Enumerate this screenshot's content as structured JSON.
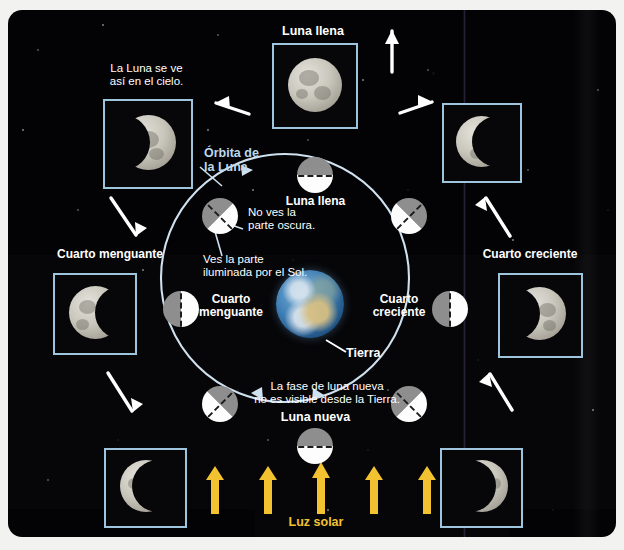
{
  "diagram": {
    "language": "es"
  },
  "colors": {
    "frame_border": "#9fc4dd",
    "orbit_line": "#cfe0ee",
    "accent_blue": "#bcd8ee",
    "sun_yellow": "#f2c230",
    "sky": "#060608",
    "moon_lit": "#fdfdfd",
    "moon_dark": "#8e8e8e"
  },
  "photos": [
    {
      "id": "photo-waning-gibbous",
      "label": "",
      "caption": "La Luna se ve\nasí en el cielo.",
      "caption_line1": "La Luna se ve",
      "caption_line2": "así en el cielo.",
      "phase": "waning-gibbous"
    },
    {
      "id": "photo-full-moon",
      "label": "Luna llena",
      "phase": "full"
    },
    {
      "id": "photo-waxing-gibbous",
      "label": "",
      "phase": "waxing-gibbous"
    },
    {
      "id": "photo-last-quarter",
      "label": "Cuarto menguante",
      "phase": "last-quarter"
    },
    {
      "id": "photo-first-quarter",
      "label": "Cuarto creciente",
      "phase": "first-quarter"
    },
    {
      "id": "photo-waning-crescent",
      "label": "",
      "phase": "waning-crescent"
    },
    {
      "id": "photo-waxing-crescent",
      "label": "",
      "phase": "waxing-crescent"
    }
  ],
  "labels": {
    "orbit_line1": "Órbita de",
    "orbit_line2": "la Luna",
    "full_moon": "Luna llena",
    "new_moon": "Luna nueva",
    "last_quarter_line1": "Cuarto",
    "last_quarter_line2": "menguante",
    "first_quarter_line1": "Cuarto",
    "first_quarter_line2": "creciente",
    "earth": "Tierra",
    "sunlight": "Luz solar",
    "photo_top_caption_line1": "La Luna se ve",
    "photo_top_caption_line2": "así en el cielo.",
    "photo_full_moon": "Luna llena",
    "photo_last_quarter": "Cuarto menguante",
    "photo_first_quarter": "Cuarto creciente",
    "note_dark_line1": "No ves la",
    "note_dark_line2": "parte oscura.",
    "note_lit_line1": "Ves la parte",
    "note_lit_line2": "iluminada por el Sol.",
    "note_new_line1": "La fase de luna nueva",
    "note_new_line2": "no es visible desde la Tierra."
  },
  "orbit_moons": [
    {
      "name": "moon-full",
      "position": "top",
      "angle_deg": 0,
      "divider_deg": 0,
      "dark_side": "top"
    },
    {
      "name": "moon-waning-gibbous",
      "position": "upper-left",
      "angle_deg": 315,
      "divider_deg": 45,
      "dark_side": "upper-left"
    },
    {
      "name": "moon-waxing-gibbous",
      "position": "upper-right",
      "angle_deg": 45,
      "divider_deg": 135,
      "dark_side": "upper-right"
    },
    {
      "name": "moon-last-quarter",
      "position": "left",
      "angle_deg": 270,
      "divider_deg": 90,
      "dark_side": "left"
    },
    {
      "name": "moon-first-quarter",
      "position": "right",
      "angle_deg": 90,
      "divider_deg": 90,
      "dark_side": "left"
    },
    {
      "name": "moon-waning-crescent",
      "position": "lower-left",
      "angle_deg": 225,
      "divider_deg": 135,
      "dark_side": "lower-left"
    },
    {
      "name": "moon-waxing-crescent",
      "position": "lower-right",
      "angle_deg": 135,
      "divider_deg": 45,
      "dark_side": "lower-right"
    },
    {
      "name": "moon-new",
      "position": "bottom",
      "angle_deg": 180,
      "divider_deg": 0,
      "dark_side": "top"
    }
  ],
  "sun_arrows": {
    "count": 5,
    "direction": "up",
    "color": "#f2c230"
  },
  "pointer_arrows": [
    {
      "name": "arrow-to-photo-waning-gibbous",
      "direction": "up-left"
    },
    {
      "name": "arrow-to-photo-full-moon",
      "direction": "up"
    },
    {
      "name": "arrow-to-photo-waxing-gibbous",
      "direction": "up-right"
    },
    {
      "name": "arrow-to-photo-last-quarter",
      "direction": "down-left"
    },
    {
      "name": "arrow-to-photo-first-quarter",
      "direction": "up-right"
    },
    {
      "name": "arrow-to-photo-waning-crescent",
      "direction": "down-left"
    },
    {
      "name": "arrow-to-photo-waxing-crescent",
      "direction": "down-right"
    }
  ]
}
